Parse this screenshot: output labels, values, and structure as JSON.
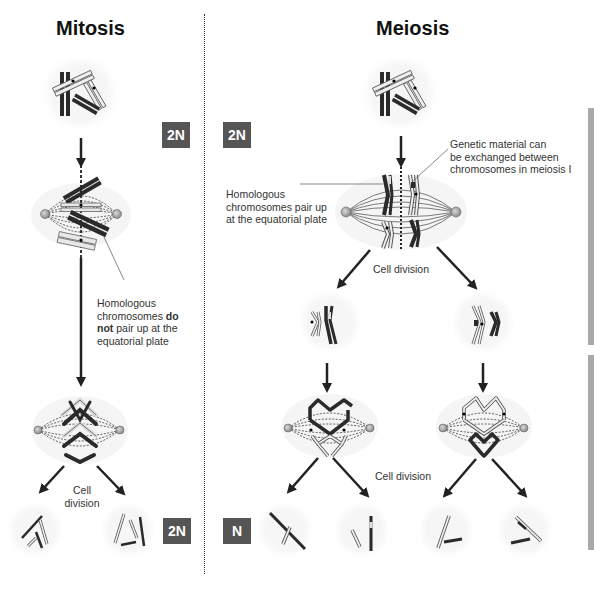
{
  "titles": {
    "mitosis": "Mitosis",
    "meiosis": "Meiosis"
  },
  "ploidy_badges": {
    "mitosis_start": "2N",
    "meiosis_start": "2N",
    "mitosis_end": "2N",
    "meiosis_end": "N"
  },
  "annotations": {
    "mitosis_no_pairing": {
      "line1": "Homologous",
      "line2_prefix": "chromosomes ",
      "line2_bold": "do",
      "line3_bold": "not",
      "line3_suffix": " pair up at the",
      "line4": "equatorial plate"
    },
    "meiosis_pairing": {
      "line1": "Homologous",
      "line2": "chromosomes pair up",
      "line3": "at the equatorial plate"
    },
    "meiosis_exchange": {
      "line1": "Genetic material can",
      "line2": "be exchanged between",
      "line3": "chromosomes in meiosis I"
    },
    "mitosis_cell_division": {
      "line1": "Cell",
      "line2": "division"
    },
    "meiosis_cell_division_1": "Cell division",
    "meiosis_cell_division_2": "Cell division"
  },
  "colors": {
    "badge_bg": "#555555",
    "sidebar": "#a9a9a9",
    "chromosome_dark": "#2a2a2a",
    "chromosome_light": "#e6e6e6",
    "centrosome": "#a0a0a0",
    "cell_halo": "#f4f4f4"
  },
  "bottom_caption_partial": "…cut-off caption text at bottom edge…"
}
